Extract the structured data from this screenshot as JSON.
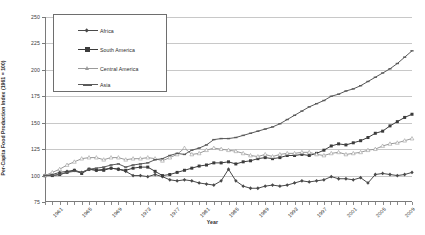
{
  "chart_data": {
    "type": "line",
    "title": "",
    "xlabel": "Year",
    "ylabel": "Per-Capita Food Production Index (1961 = 100)",
    "ylim": [
      75,
      250
    ],
    "yticks": [
      75,
      100,
      125,
      150,
      175,
      200,
      225,
      250
    ],
    "xlim": [
      1961,
      2011
    ],
    "grid": true,
    "legend_position": "top-left-inside",
    "xtick_labels": [
      "1961",
      "1965",
      "1969",
      "1973",
      "1977",
      "1981",
      "1985",
      "1989",
      "1993",
      "1997",
      "2001",
      "2005",
      "2009"
    ],
    "x": [
      1961,
      1962,
      1963,
      1964,
      1965,
      1966,
      1967,
      1968,
      1969,
      1970,
      1971,
      1972,
      1973,
      1974,
      1975,
      1976,
      1977,
      1978,
      1979,
      1980,
      1981,
      1982,
      1983,
      1984,
      1985,
      1986,
      1987,
      1988,
      1989,
      1990,
      1991,
      1992,
      1993,
      1994,
      1995,
      1996,
      1997,
      1998,
      1999,
      2000,
      2001,
      2002,
      2003,
      2004,
      2005,
      2006,
      2007,
      2008,
      2009,
      2010,
      2011
    ],
    "series": [
      {
        "name": "Africa",
        "color": "#4a4a4a",
        "marker": "diamond-small",
        "values": [
          100,
          101,
          103,
          104,
          105,
          103,
          106,
          105,
          106,
          107,
          106,
          104,
          100,
          100,
          99,
          101,
          99,
          96,
          95,
          96,
          95,
          93,
          92,
          91,
          95,
          106,
          95,
          90,
          88,
          88,
          90,
          91,
          90,
          91,
          93,
          95,
          94,
          95,
          96,
          99,
          97,
          97,
          96,
          98,
          93,
          101,
          102,
          101,
          100,
          101,
          103
        ]
      },
      {
        "name": "South America",
        "color": "#3c3c3c",
        "marker": "square",
        "values": [
          100,
          100,
          101,
          103,
          105,
          102,
          106,
          105,
          105,
          107,
          106,
          105,
          107,
          108,
          108,
          104,
          100,
          101,
          103,
          105,
          107,
          109,
          110,
          112,
          112,
          113,
          111,
          113,
          114,
          116,
          117,
          116,
          117,
          119,
          119,
          120,
          119,
          121,
          124,
          128,
          130,
          129,
          131,
          133,
          136,
          140,
          142,
          147,
          151,
          155,
          158
        ]
      },
      {
        "name": "Central America",
        "color": "#9a9a9a",
        "marker": "triangle-open",
        "values": [
          100,
          103,
          106,
          110,
          113,
          116,
          117,
          117,
          115,
          117,
          117,
          115,
          116,
          116,
          117,
          116,
          114,
          117,
          120,
          126,
          120,
          121,
          124,
          126,
          125,
          124,
          123,
          121,
          119,
          118,
          120,
          118,
          120,
          121,
          121,
          122,
          122,
          120,
          119,
          121,
          122,
          120,
          121,
          122,
          124,
          125,
          128,
          130,
          131,
          133,
          135
        ]
      },
      {
        "name": "Asia",
        "color": "#5a5a5a",
        "marker": "dash",
        "values": [
          100,
          100,
          101,
          103,
          104,
          103,
          106,
          107,
          108,
          110,
          111,
          108,
          110,
          111,
          112,
          115,
          116,
          119,
          121,
          120,
          124,
          126,
          129,
          134,
          135,
          135,
          136,
          138,
          140,
          142,
          144,
          146,
          149,
          153,
          157,
          161,
          165,
          168,
          171,
          175,
          177,
          180,
          182,
          185,
          189,
          193,
          197,
          201,
          206,
          212,
          218
        ]
      }
    ],
    "series_endpoints": {
      "Asia": 233,
      "South America": 183,
      "Central America": 137,
      "Africa": 107
    }
  }
}
